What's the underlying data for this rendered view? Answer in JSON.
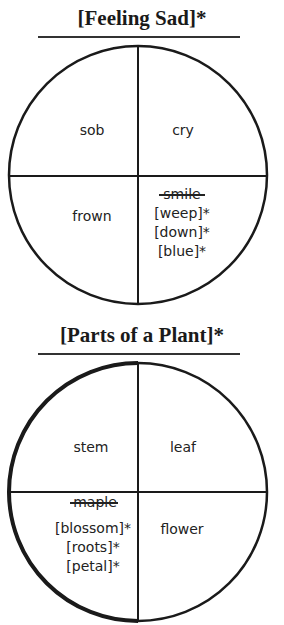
{
  "diagrams": [
    {
      "title": "[Feeling Sad]*",
      "quadrants": {
        "top_left": [
          "sob"
        ],
        "top_right": [
          "cry"
        ],
        "bottom_left": [
          "frown"
        ],
        "bottom_right": {
          "struck": "smile",
          "items": [
            "[weep]*",
            "[down]*",
            "[blue]*"
          ]
        }
      }
    },
    {
      "title": "[Parts of a Plant]*",
      "quadrants": {
        "top_left": [
          "stem"
        ],
        "top_right": [
          "leaf"
        ],
        "bottom_left": {
          "struck": "maple",
          "items": [
            "[blossom]*",
            "[roots]*",
            "[petal]*"
          ]
        },
        "bottom_right": [
          "flower"
        ]
      }
    }
  ]
}
